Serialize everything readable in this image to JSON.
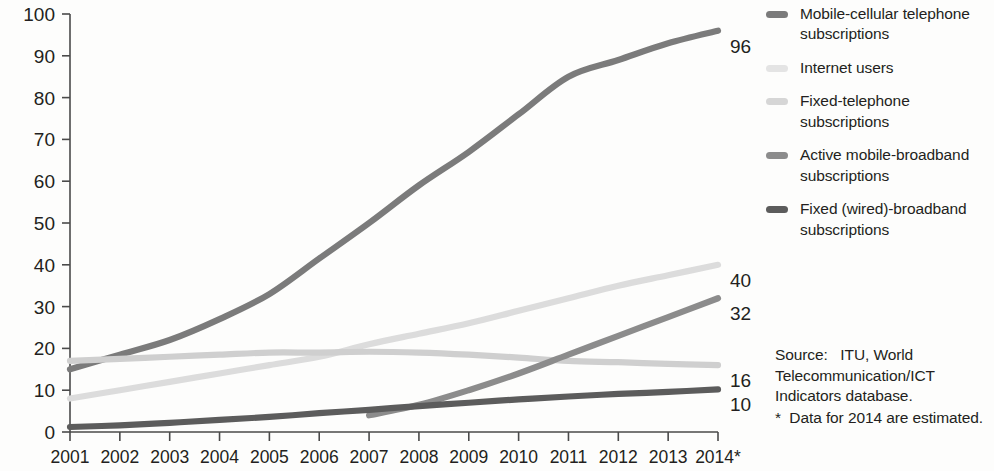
{
  "chart_data": {
    "type": "line",
    "title": "",
    "subtitle": "",
    "xlabel": "",
    "ylabel": "",
    "grid": false,
    "legend_position": "right",
    "xlim": [
      2001,
      2014
    ],
    "ylim": [
      0,
      100
    ],
    "x": [
      "2001",
      "2002",
      "2003",
      "2004",
      "2005",
      "2006",
      "2007",
      "2008",
      "2009",
      "2010",
      "2011",
      "2012",
      "2013",
      "2014*"
    ],
    "yticks": [
      "0",
      "10",
      "20",
      "30",
      "40",
      "50",
      "60",
      "70",
      "80",
      "90",
      "100"
    ],
    "series": [
      {
        "name": "Mobile-cellular telephone subscriptions",
        "color": "#7b7b7b",
        "end_label": "96",
        "values": [
          15,
          18.5,
          22,
          27,
          33,
          41.5,
          50,
          59,
          67,
          76,
          85,
          89,
          93,
          96
        ]
      },
      {
        "name": "Internet users",
        "color": "#dcdcdc",
        "end_label": "40",
        "values": [
          8,
          10,
          12,
          14,
          16,
          18,
          21,
          23.5,
          26,
          29,
          32,
          35,
          37.5,
          40
        ]
      },
      {
        "name": "Fixed-telephone subscriptions",
        "color": "#cfcfcf",
        "end_label": "16",
        "values": [
          17,
          17.5,
          18,
          18.5,
          19,
          19,
          19.2,
          19,
          18.5,
          17.8,
          17,
          16.7,
          16.3,
          16
        ]
      },
      {
        "name": "Active mobile-broadband subscriptions",
        "color": "#8c8c8c",
        "end_label": "32",
        "values": [
          null,
          null,
          null,
          null,
          null,
          null,
          4,
          6.5,
          10,
          14,
          18.5,
          23,
          27.5,
          32
        ]
      },
      {
        "name": "Fixed (wired)-broadband subscriptions",
        "color": "#5c5c5c",
        "end_label": "10",
        "values": [
          1.2,
          1.6,
          2.2,
          2.9,
          3.6,
          4.5,
          5.3,
          6.2,
          7,
          7.8,
          8.5,
          9.1,
          9.6,
          10.2
        ]
      }
    ]
  },
  "legend": {
    "items": [
      {
        "label": "Mobile-cellular telephone subscriptions",
        "color": "#7b7b7b"
      },
      {
        "label": "Internet users",
        "color": "#e4e4e4"
      },
      {
        "label": "Fixed-telephone subscriptions",
        "color": "#d6d6d6"
      },
      {
        "label": "Active mobile-broadband subscriptions",
        "color": "#8c8c8c"
      },
      {
        "label": "Fixed (wired)-broadband subscriptions",
        "color": "#5c5c5c"
      }
    ]
  },
  "source": {
    "line1": "Source:   ITU, World",
    "line2": "Telecommunication/ICT",
    "line3": "Indicators database.",
    "note": "*  Data for 2014 are estimated."
  }
}
